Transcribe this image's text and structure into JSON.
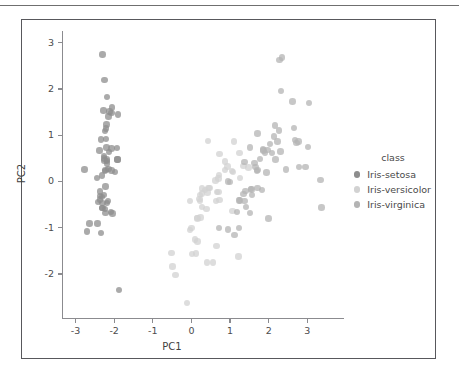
{
  "figure": {
    "border_color": "#58585c",
    "background": "#ffffff"
  },
  "legend": {
    "title": "class",
    "entries": [
      {
        "label": "Iris-setosa",
        "color": "#8d8d8d"
      },
      {
        "label": "Iris-versicolor",
        "color": "#d2d2d2"
      },
      {
        "label": "Iris-virginica",
        "color": "#b4b4b4"
      }
    ]
  },
  "chart_data": {
    "type": "scatter",
    "title": "",
    "xlabel": "PC1",
    "ylabel": "PC2",
    "xlim": [
      -3.35,
      3.95
    ],
    "ylim": [
      -2.95,
      3.25
    ],
    "xticks": [
      -3,
      -2,
      -1,
      0,
      1,
      2,
      3
    ],
    "yticks": [
      -2,
      -1,
      0,
      1,
      2,
      3
    ],
    "xticklabels": [
      "-3",
      "-2",
      "-1",
      "0",
      "1",
      "2",
      "3"
    ],
    "yticklabels": [
      "-2",
      "-1",
      "0",
      "1",
      "2",
      "3"
    ],
    "grid": false,
    "legend_position": "right",
    "marker_size": 6.4,
    "marker_alpha": 0.75,
    "series": [
      {
        "name": "Iris-setosa",
        "color": "#8d8d8d",
        "points": [
          [
            -2.26,
            0.5
          ],
          [
            -2.08,
            -0.66
          ],
          [
            -2.36,
            -0.32
          ],
          [
            -2.3,
            -0.57
          ],
          [
            -2.38,
            0.67
          ],
          [
            -2.07,
            1.48
          ],
          [
            -2.44,
            0.08
          ],
          [
            -2.23,
            0.22
          ],
          [
            -2.34,
            -1.11
          ],
          [
            -2.18,
            -0.46
          ],
          [
            -2.15,
            1.4
          ],
          [
            -2.32,
            0.13
          ],
          [
            -2.22,
            -0.68
          ],
          [
            -2.64,
            -0.91
          ],
          [
            -2.19,
            1.83
          ],
          [
            -2.25,
            2.19
          ],
          [
            -2.2,
            1.23
          ],
          [
            -2.19,
            0.47
          ],
          [
            -1.9,
            1.45
          ],
          [
            -2.34,
            0.91
          ],
          [
            -1.91,
            0.47
          ],
          [
            -2.2,
            0.73
          ],
          [
            -2.77,
            0.26
          ],
          [
            -1.98,
            0.2
          ],
          [
            -2.22,
            -0.11
          ],
          [
            -2.04,
            -0.69
          ],
          [
            -2.07,
            0.24
          ],
          [
            -2.18,
            0.44
          ],
          [
            -2.19,
            0.39
          ],
          [
            -2.32,
            -0.33
          ],
          [
            -2.3,
            -0.46
          ],
          [
            -1.91,
            0.47
          ],
          [
            -2.21,
            1.14
          ],
          [
            -2.05,
            1.6
          ],
          [
            -2.16,
            -0.42
          ],
          [
            -2.27,
            -0.29
          ],
          [
            -1.92,
            0.72
          ],
          [
            -2.25,
            0.45
          ],
          [
            -2.43,
            -0.91
          ],
          [
            -2.15,
            0.27
          ],
          [
            -2.26,
            0.55
          ],
          [
            -2.71,
            -1.08
          ],
          [
            -2.42,
            -0.44
          ],
          [
            -2.07,
            0.71
          ],
          [
            -2.23,
            1.09
          ],
          [
            -2.37,
            -0.39
          ],
          [
            -2.21,
            0.92
          ],
          [
            -2.37,
            -0.22
          ],
          [
            -2.13,
            0.64
          ],
          [
            -2.22,
            0.25
          ],
          [
            -2.3,
            2.74
          ],
          [
            -1.88,
            -2.34
          ],
          [
            -2.28,
            1.53
          ],
          [
            -2.12,
            1.51
          ],
          [
            -2.24,
            -0.6
          ],
          [
            -2.31,
            -0.58
          ]
        ]
      },
      {
        "name": "Iris-versicolor",
        "color": "#d2d2d2",
        "points": [
          [
            1.1,
            0.86
          ],
          [
            0.73,
            0.59
          ],
          [
            1.24,
            0.61
          ],
          [
            0.4,
            -1.75
          ],
          [
            1.07,
            0.21
          ],
          [
            0.39,
            -0.59
          ],
          [
            1.48,
            0.3
          ],
          [
            -0.52,
            -1.55
          ],
          [
            0.93,
            0.32
          ],
          [
            0.0,
            -1.0
          ],
          [
            -0.11,
            -2.63
          ],
          [
            0.44,
            -0.14
          ],
          [
            0.56,
            -1.75
          ],
          [
            0.72,
            0.14
          ],
          [
            -0.03,
            -0.42
          ],
          [
            0.87,
            0.43
          ],
          [
            0.35,
            -0.18
          ],
          [
            0.16,
            -0.8
          ],
          [
            1.22,
            -1.62
          ],
          [
            0.16,
            -1.3
          ],
          [
            0.73,
            -0.4
          ],
          [
            0.47,
            -0.14
          ],
          [
            1.23,
            -0.4
          ],
          [
            0.63,
            -0.42
          ],
          [
            0.7,
            0.06
          ],
          [
            0.87,
            0.25
          ],
          [
            1.25,
            0.08
          ],
          [
            1.35,
            0.33
          ],
          [
            0.66,
            -0.23
          ],
          [
            -0.04,
            -1.05
          ],
          [
            0.12,
            -1.56
          ],
          [
            0.02,
            -1.57
          ],
          [
            0.24,
            -0.78
          ],
          [
            1.06,
            -0.64
          ],
          [
            0.22,
            -0.29
          ],
          [
            0.43,
            0.88
          ],
          [
            1.05,
            0.22
          ],
          [
            0.65,
            -1.4
          ],
          [
            0.42,
            -0.24
          ],
          [
            0.09,
            -1.25
          ],
          [
            0.15,
            -0.79
          ],
          [
            0.7,
            -0.23
          ],
          [
            0.27,
            -0.55
          ],
          [
            -0.49,
            -1.84
          ],
          [
            0.23,
            -0.42
          ],
          [
            0.28,
            -0.26
          ],
          [
            0.27,
            -0.15
          ],
          [
            0.62,
            0.02
          ],
          [
            -0.41,
            -2.02
          ],
          [
            0.21,
            -0.38
          ]
        ]
      },
      {
        "name": "Iris-virginica",
        "color": "#b4b4b4",
        "points": [
          [
            1.87,
            0.67
          ],
          [
            1.57,
            -0.29
          ],
          [
            2.45,
            0.26
          ],
          [
            1.35,
            -0.27
          ],
          [
            1.94,
            0.19
          ],
          [
            3.02,
            0.75
          ],
          [
            0.71,
            -1.01
          ],
          [
            2.79,
            0.31
          ],
          [
            2.0,
            -0.8
          ],
          [
            2.62,
            1.73
          ],
          [
            1.7,
            0.23
          ],
          [
            1.82,
            -0.19
          ],
          [
            2.18,
            0.47
          ],
          [
            1.12,
            -1.16
          ],
          [
            1.41,
            -0.55
          ],
          [
            1.85,
            0.69
          ],
          [
            1.71,
            0.25
          ],
          [
            3.34,
            0.03
          ],
          [
            3.37,
            -0.56
          ],
          [
            0.94,
            -1.04
          ],
          [
            2.23,
            0.86
          ],
          [
            1.18,
            -0.66
          ],
          [
            2.95,
            0.31
          ],
          [
            1.25,
            -0.41
          ],
          [
            1.97,
            0.68
          ],
          [
            2.65,
            1.15
          ],
          [
            1.52,
            -0.68
          ],
          [
            1.4,
            -0.2
          ],
          [
            1.54,
            -0.16
          ],
          [
            2.27,
            1.1
          ],
          [
            2.31,
            0.65
          ],
          [
            3.05,
            1.69
          ],
          [
            1.56,
            -0.17
          ],
          [
            1.37,
            -0.42
          ],
          [
            1.23,
            -1.0
          ],
          [
            2.68,
            0.89
          ],
          [
            1.71,
            1.04
          ],
          [
            1.37,
            0.42
          ],
          [
            1.0,
            -0.01
          ],
          [
            1.78,
            0.49
          ],
          [
            2.04,
            0.81
          ],
          [
            1.66,
            0.31
          ],
          [
            1.23,
            -0.41
          ],
          [
            2.13,
            0.97
          ],
          [
            2.16,
            1.21
          ],
          [
            1.52,
            0.73
          ],
          [
            0.94,
            0.0
          ],
          [
            1.63,
            0.4
          ],
          [
            2.32,
            1.95
          ],
          [
            1.71,
            -0.14
          ],
          [
            2.28,
            2.62
          ],
          [
            2.35,
            2.68
          ],
          [
            2.72,
            0.83
          ],
          [
            2.77,
            0.86
          ],
          [
            1.9,
            0.62
          ],
          [
            2.09,
            0.61
          ]
        ]
      }
    ]
  }
}
